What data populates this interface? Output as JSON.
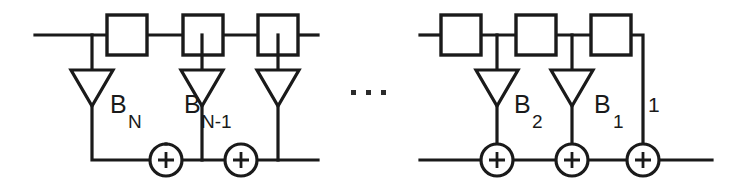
{
  "figure": {
    "type": "block-diagram",
    "background_color": "#ffffff",
    "line_color": "#1a1a1a",
    "width": 746,
    "height": 192
  },
  "labels": {
    "b_n": {
      "base": "B",
      "sub": "N"
    },
    "b_n_minus_1": {
      "base": "B",
      "sub": "N-1"
    },
    "b_2": {
      "base": "B",
      "sub": "2"
    },
    "b_1": {
      "base": "B",
      "sub": "1"
    },
    "unity": "1",
    "ellipsis": "· · ·"
  },
  "symbols": {
    "sum_operator": "+",
    "delay_block_label": "",
    "gain_triangle_label": ""
  },
  "structure": {
    "delay_blocks": [
      {
        "id": "delay-1",
        "x": 107,
        "y": 15,
        "w": 40,
        "h": 40
      },
      {
        "id": "delay-2",
        "x": 183,
        "y": 15,
        "w": 40,
        "h": 40
      },
      {
        "id": "delay-3",
        "x": 258,
        "y": 15,
        "w": 40,
        "h": 40
      },
      {
        "id": "delay-4",
        "x": 441,
        "y": 15,
        "w": 40,
        "h": 40
      },
      {
        "id": "delay-5",
        "x": 516,
        "y": 15,
        "w": 40,
        "h": 40
      },
      {
        "id": "delay-6",
        "x": 591,
        "y": 15,
        "w": 40,
        "h": 40
      }
    ],
    "gain_triangles": [
      {
        "id": "gain-bn",
        "cx": 92,
        "top": 70,
        "apex": 106,
        "half": 21
      },
      {
        "id": "gain-bn1",
        "cx": 202,
        "top": 70,
        "apex": 106,
        "half": 21
      },
      {
        "id": "gain-bn2",
        "cx": 278,
        "top": 70,
        "apex": 106,
        "half": 21
      },
      {
        "id": "gain-b2",
        "cx": 497,
        "top": 70,
        "apex": 106,
        "half": 21
      },
      {
        "id": "gain-b1",
        "cx": 572,
        "top": 70,
        "apex": 106,
        "half": 21
      }
    ],
    "summing_nodes": [
      {
        "id": "sum-1",
        "cx": 166,
        "cy": 160,
        "r": 16
      },
      {
        "id": "sum-2",
        "cx": 241,
        "cy": 160,
        "r": 16
      },
      {
        "id": "sum-3",
        "cx": 497,
        "cy": 160,
        "r": 16
      },
      {
        "id": "sum-4",
        "cx": 572,
        "cy": 160,
        "r": 16
      },
      {
        "id": "sum-5",
        "cx": 643,
        "cy": 160,
        "r": 16
      }
    ],
    "top_rail_y": 35,
    "bottom_rail_y": 160
  }
}
